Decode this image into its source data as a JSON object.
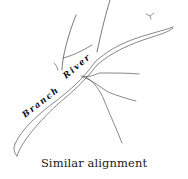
{
  "diagram": {
    "caption": "Similar alignment",
    "labels": {
      "word1": "Branch",
      "word2": "River"
    },
    "colors": {
      "line": "#555555",
      "text": "#111111",
      "background": "#ffffff"
    }
  }
}
